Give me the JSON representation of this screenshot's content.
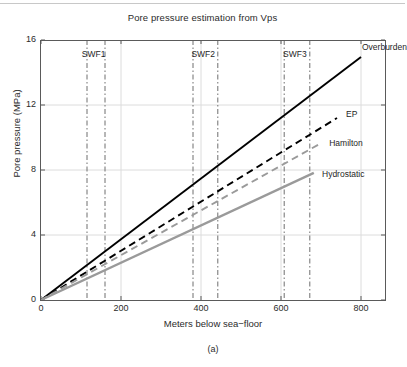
{
  "figure": {
    "title": "Pore pressure estimation from Vps",
    "subcaption": "(a)"
  },
  "chart_data": {
    "type": "line",
    "title": "Pore pressure estimation from Vps",
    "xlabel": "Meters below sea−floor",
    "ylabel": "Pore pressure (MPa)",
    "xlim": [
      0,
      860
    ],
    "ylim": [
      0,
      16
    ],
    "xticks": [
      0,
      200,
      400,
      600,
      800
    ],
    "xtick_labels": [
      "0",
      "200",
      "400",
      "600",
      "800"
    ],
    "yticks": [
      0,
      4,
      8,
      12,
      16
    ],
    "ytick_labels": [
      "0",
      "4",
      "8",
      "12",
      "16"
    ],
    "grid": true,
    "legend_position": "inline-right-of-curve-ends",
    "series": [
      {
        "name": "Overburden",
        "color": "#000000",
        "style": "solid",
        "width": 1.9,
        "x": [
          0,
          800
        ],
        "y": [
          0,
          14.95
        ],
        "label_x": 800,
        "label_y": 15.5
      },
      {
        "name": "EP",
        "color": "#000000",
        "style": "dashed",
        "width": 1.9,
        "x": [
          0,
          740
        ],
        "y": [
          0,
          11.2
        ],
        "label_x": 760,
        "label_y": 11.4
      },
      {
        "name": "Hamilton",
        "color": "#9a9a9a",
        "style": "dashed",
        "width": 1.9,
        "x": [
          0,
          700
        ],
        "y": [
          0,
          9.65
        ],
        "label_x": 718,
        "label_y": 9.6
      },
      {
        "name": "Hydrostatic",
        "color": "#9a9a9a",
        "style": "solid",
        "width": 2.4,
        "x": [
          0,
          682
        ],
        "y": [
          0,
          7.82
        ],
        "label_x": 700,
        "label_y": 7.7
      }
    ],
    "annotations": [
      {
        "label": "SWF1",
        "lines_x": [
          115,
          160
        ],
        "label_x": 137,
        "label_y": 15.1
      },
      {
        "label": "SWF2",
        "lines_x": [
          380,
          442
        ],
        "label_x": 411,
        "label_y": 15.1
      },
      {
        "label": "SWF3",
        "lines_x": [
          608,
          672
        ],
        "label_x": 640,
        "label_y": 15.1
      }
    ],
    "vline_style": "dash-dot",
    "vline_color": "#6e6e6e"
  }
}
